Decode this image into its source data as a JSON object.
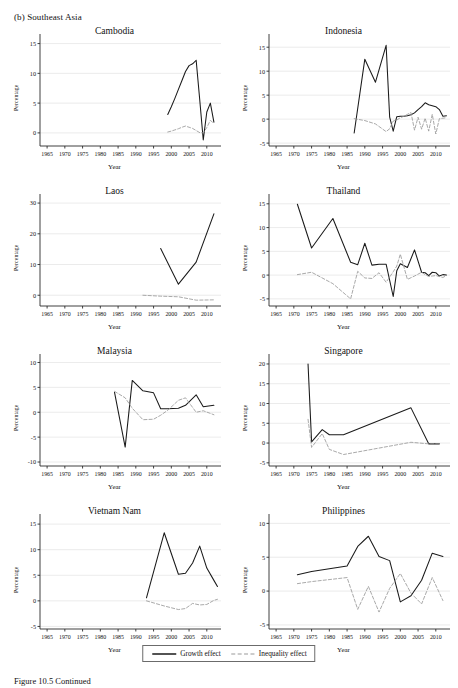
{
  "figure": {
    "panel_label": "(b) Southeast Asia",
    "caption": "Figure 10.5  Continued",
    "legend": {
      "growth_label": "Growth effect",
      "inequality_label": "Inequality effect",
      "growth_color": "#1a1a1a",
      "inequality_color": "#9a9a9a"
    }
  },
  "chart_data": [
    {
      "type": "line",
      "title": "Cambodia",
      "xlabel": "Year",
      "ylabel": "Percentage",
      "xlim": [
        1963,
        2014
      ],
      "ylim": [
        -2.2,
        15.6
      ],
      "xticks": [
        1965,
        1970,
        1975,
        1980,
        1985,
        1990,
        1995,
        2000,
        2005,
        2010
      ],
      "yticks": [
        0,
        5,
        10,
        15
      ],
      "grid": true,
      "legend_position": "figure-bottom",
      "series": [
        {
          "name": "Growth effect",
          "x": [
            1999,
            2000,
            2001,
            2002,
            2003,
            2004,
            2005,
            2006,
            2007,
            2008,
            2009,
            2010,
            2011,
            2012
          ],
          "values": [
            3.1,
            4.4,
            5.8,
            7.3,
            8.8,
            10.3,
            11.3,
            11.6,
            12.2,
            5.6,
            -1.2,
            3.5,
            5.0,
            1.8
          ]
        },
        {
          "name": "Inequality effect",
          "x": [
            1999,
            2000,
            2001,
            2002,
            2003,
            2004,
            2005,
            2006,
            2007,
            2008,
            2009,
            2010,
            2011,
            2012
          ],
          "values": [
            0.15,
            0.3,
            0.5,
            0.7,
            0.95,
            1.15,
            0.95,
            0.75,
            0.4,
            0.05,
            0.0,
            0.9,
            2.1,
            1.6
          ]
        }
      ]
    },
    {
      "type": "line",
      "title": "Indonesia",
      "xlabel": "Year",
      "ylabel": "Percentage",
      "xlim": [
        1963,
        2014
      ],
      "ylim": [
        -5.6,
        16.5
      ],
      "xticks": [
        1965,
        1970,
        1975,
        1980,
        1985,
        1990,
        1995,
        2000,
        2005,
        2010
      ],
      "yticks": [
        -5,
        0,
        5,
        10,
        15
      ],
      "grid": true,
      "legend_position": "figure-bottom",
      "series": [
        {
          "name": "Growth effect",
          "x": [
            1987,
            1990,
            1993,
            1996,
            1997,
            1998,
            1999,
            2000,
            2001,
            2002,
            2003,
            2004,
            2005,
            2006,
            2007,
            2008,
            2009,
            2010,
            2011,
            2012,
            2013
          ],
          "values": [
            -2.9,
            12.5,
            7.7,
            15.4,
            0.4,
            -2.5,
            0.5,
            0.6,
            0.6,
            0.7,
            0.9,
            1.3,
            2.0,
            2.6,
            3.4,
            3.0,
            2.8,
            2.6,
            2.0,
            0.6,
            0.7
          ]
        },
        {
          "name": "Inequality effect",
          "x": [
            1987,
            1990,
            1993,
            1996,
            1997,
            1998,
            1999,
            2000,
            2001,
            2002,
            2003,
            2004,
            2005,
            2006,
            2007,
            2008,
            2009,
            2010,
            2011,
            2012,
            2013
          ],
          "values": [
            0.1,
            -0.3,
            -1.0,
            -2.6,
            -2.0,
            -0.4,
            -0.2,
            0.3,
            0.6,
            1.0,
            1.4,
            -2.3,
            0.4,
            -2.1,
            0.2,
            -2.5,
            1.0,
            -3.1,
            0.1,
            0.2,
            0.3
          ]
        }
      ]
    },
    {
      "type": "line",
      "title": "Laos",
      "xlabel": "Year",
      "ylabel": "Percentage",
      "xlim": [
        1963,
        2014
      ],
      "ylim": [
        -3.5,
        31
      ],
      "xticks": [
        1965,
        1970,
        1975,
        1980,
        1985,
        1990,
        1995,
        2000,
        2005,
        2010
      ],
      "yticks": [
        0,
        10,
        20,
        30
      ],
      "grid": true,
      "legend_position": "figure-bottom",
      "series": [
        {
          "name": "Growth effect",
          "x": [
            1997,
            2002,
            2007,
            2012
          ],
          "values": [
            15.2,
            3.6,
            10.8,
            26.5
          ]
        },
        {
          "name": "Inequality effect",
          "x": [
            1992,
            1997,
            2002,
            2007,
            2012
          ],
          "values": [
            0.0,
            -0.3,
            -0.5,
            -1.6,
            -1.5
          ]
        }
      ]
    },
    {
      "type": "line",
      "title": "Thailand",
      "xlabel": "Year",
      "ylabel": "Percentage",
      "xlim": [
        1963,
        2014
      ],
      "ylim": [
        -6.5,
        15.8
      ],
      "xticks": [
        1965,
        1970,
        1975,
        1980,
        1985,
        1990,
        1995,
        2000,
        2005,
        2010
      ],
      "yticks": [
        -5,
        0,
        5,
        10,
        15
      ],
      "grid": true,
      "legend_position": "figure-bottom",
      "series": [
        {
          "name": "Growth effect",
          "x": [
            1971,
            1975,
            1981,
            1986,
            1988,
            1990,
            1992,
            1994,
            1996,
            1998,
            1999,
            2000,
            2002,
            2004,
            2006,
            2007,
            2008,
            2009,
            2010,
            2011,
            2012,
            2013
          ],
          "values": [
            14.9,
            5.7,
            11.9,
            2.7,
            2.2,
            6.7,
            2.1,
            2.3,
            2.3,
            -4.5,
            0.9,
            2.4,
            1.6,
            5.3,
            0.6,
            0.5,
            -0.1,
            0.6,
            0.5,
            -0.2,
            0.1,
            0.0
          ]
        },
        {
          "name": "Inequality effect",
          "x": [
            1971,
            1975,
            1981,
            1986,
            1988,
            1990,
            1992,
            1994,
            1996,
            1998,
            1999,
            2000,
            2002,
            2004,
            2006,
            2007,
            2008,
            2009,
            2010,
            2011,
            2012,
            2013
          ],
          "values": [
            0.1,
            0.6,
            -1.8,
            -5.0,
            0.8,
            -0.6,
            -0.7,
            0.5,
            -1.5,
            0.7,
            1.9,
            4.4,
            -0.9,
            -0.2,
            0.6,
            0.1,
            -0.3,
            -0.2,
            -0.1,
            -0.3,
            -0.5,
            -0.1
          ]
        }
      ]
    },
    {
      "type": "line",
      "title": "Malaysia",
      "xlabel": "Year",
      "ylabel": "Percentage",
      "xlim": [
        1963,
        2014
      ],
      "ylim": [
        -10.8,
        10.5
      ],
      "xticks": [
        1965,
        1970,
        1975,
        1980,
        1985,
        1990,
        1995,
        2000,
        2005,
        2010
      ],
      "yticks": [
        -10,
        -5,
        0,
        5,
        10
      ],
      "grid": true,
      "legend_position": "figure-bottom",
      "series": [
        {
          "name": "Growth effect",
          "x": [
            1984,
            1987,
            1989,
            1992,
            1995,
            1997,
            1999,
            2002,
            2004,
            2007,
            2009,
            2012
          ],
          "values": [
            4.0,
            -7.0,
            6.4,
            4.3,
            3.9,
            0.7,
            0.7,
            0.8,
            1.4,
            3.5,
            1.1,
            1.4
          ]
        },
        {
          "name": "Inequality effect",
          "x": [
            1984,
            1987,
            1989,
            1992,
            1995,
            1997,
            1999,
            2002,
            2004,
            2007,
            2009,
            2012
          ],
          "values": [
            4.2,
            2.9,
            0.8,
            -1.5,
            -1.4,
            -0.6,
            0.4,
            2.4,
            2.9,
            0.0,
            0.3,
            -0.5
          ]
        }
      ]
    },
    {
      "type": "line",
      "title": "Singapore",
      "xlabel": "Year",
      "ylabel": "Percentage",
      "xlim": [
        1963,
        2014
      ],
      "ylim": [
        -5.8,
        21
      ],
      "xticks": [
        1965,
        1970,
        1975,
        1980,
        1985,
        1990,
        1995,
        2000,
        2005,
        2010
      ],
      "yticks": [
        -5,
        0,
        5,
        10,
        15,
        20
      ],
      "grid": true,
      "legend_position": "figure-bottom",
      "series": [
        {
          "name": "Growth effect",
          "x": [
            1974,
            1975,
            1978,
            1980,
            1984,
            2003,
            2008,
            2011
          ],
          "values": [
            20.0,
            0.3,
            3.4,
            2.1,
            2.1,
            8.9,
            -0.2,
            -0.2
          ]
        },
        {
          "name": "Inequality effect",
          "x": [
            1974,
            1975,
            1978,
            1980,
            1984,
            2003,
            2008,
            2011
          ],
          "values": [
            6.0,
            -1.1,
            2.4,
            -1.6,
            -2.9,
            0.2,
            -0.2,
            -0.2
          ]
        }
      ]
    },
    {
      "type": "line",
      "title": "Vietnam Nam",
      "xlabel": "Year",
      "ylabel": "Percentage",
      "xlim": [
        1963,
        2014
      ],
      "ylim": [
        -5.5,
        15.8
      ],
      "xticks": [
        1965,
        1970,
        1975,
        1980,
        1985,
        1990,
        1995,
        2000,
        2005,
        2010
      ],
      "yticks": [
        -5,
        0,
        5,
        10,
        15
      ],
      "grid": true,
      "legend_position": "figure-bottom",
      "series": [
        {
          "name": "Growth effect",
          "x": [
            1993,
            1998,
            2002,
            2004,
            2006,
            2008,
            2010,
            2012,
            2013
          ],
          "values": [
            0.6,
            13.3,
            5.2,
            5.4,
            7.4,
            10.7,
            6.4,
            4.0,
            2.8
          ]
        },
        {
          "name": "Inequality effect",
          "x": [
            1993,
            1998,
            2002,
            2004,
            2006,
            2008,
            2010,
            2012,
            2013
          ],
          "values": [
            0.0,
            -1.0,
            -1.7,
            -1.5,
            -0.5,
            -0.8,
            -0.7,
            0.1,
            0.3
          ]
        }
      ]
    },
    {
      "type": "line",
      "title": "Philippines",
      "xlabel": "Year",
      "ylabel": "Percentage",
      "xlim": [
        1963,
        2014
      ],
      "ylim": [
        -5.6,
        10.5
      ],
      "xticks": [
        1965,
        1970,
        1975,
        1980,
        1985,
        1990,
        1995,
        2000,
        2005,
        2010
      ],
      "yticks": [
        -5,
        0,
        5,
        10
      ],
      "grid": true,
      "legend_position": "figure-bottom",
      "series": [
        {
          "name": "Growth effect",
          "x": [
            1971,
            1975,
            1985,
            1988,
            1991,
            1994,
            1997,
            2000,
            2003,
            2006,
            2009,
            2012
          ],
          "values": [
            2.4,
            2.9,
            3.7,
            6.6,
            8.1,
            5.1,
            4.5,
            -1.6,
            -0.7,
            1.6,
            5.6,
            5.1
          ]
        },
        {
          "name": "Inequality effect",
          "x": [
            1971,
            1975,
            1985,
            1988,
            1991,
            1994,
            1997,
            2000,
            2003,
            2006,
            2009,
            2012
          ],
          "values": [
            1.1,
            1.4,
            2.0,
            -2.7,
            0.7,
            -3.1,
            0.4,
            2.6,
            -0.3,
            -1.9,
            2.0,
            -1.4
          ]
        }
      ]
    }
  ]
}
